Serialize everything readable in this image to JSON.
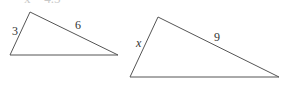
{
  "cut_off_text": "x = 4.5",
  "triangles": [
    {
      "id": "small",
      "vertices": {
        "top": [
          30,
          12
        ],
        "bottom_left": [
          10,
          55
        ],
        "bottom_right": [
          118,
          55
        ]
      },
      "labels": {
        "left_side": "3",
        "top_side": "6"
      }
    },
    {
      "id": "large",
      "vertices": {
        "top": [
          158,
          17
        ],
        "bottom_left": [
          130,
          77
        ],
        "bottom_right": [
          279,
          77
        ]
      },
      "labels": {
        "left_side": "x",
        "top_side": "9"
      }
    }
  ],
  "stroke_color": "#555555"
}
